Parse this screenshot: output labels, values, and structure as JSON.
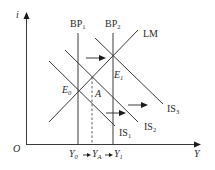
{
  "diagram": {
    "type": "IS-LM-BP",
    "axes": {
      "y_label": "i",
      "x_label": "Y",
      "origin_label": "O"
    },
    "curves": {
      "bp1": {
        "name": "BP",
        "sub": "1"
      },
      "bp2": {
        "name": "BP",
        "sub": "2"
      },
      "lm": {
        "name": "LM"
      },
      "is1": {
        "name": "IS",
        "sub": "1"
      },
      "is2": {
        "name": "IS",
        "sub": "2"
      },
      "is3": {
        "name": "IS",
        "sub": "3"
      }
    },
    "points": {
      "e0": {
        "name": "E",
        "sub": "0"
      },
      "e1": {
        "name": "E",
        "sub": "1"
      },
      "a": {
        "name": "A"
      }
    },
    "x_ticks": {
      "y0": {
        "name": "Y",
        "sub": "0"
      },
      "ya": {
        "name": "Y",
        "sub": "A"
      },
      "y1": {
        "name": "Y",
        "sub": "1"
      }
    },
    "colors": {
      "line": "#3a3a3a",
      "arrow": "#1a1a1a",
      "background": "#ffffff"
    }
  }
}
